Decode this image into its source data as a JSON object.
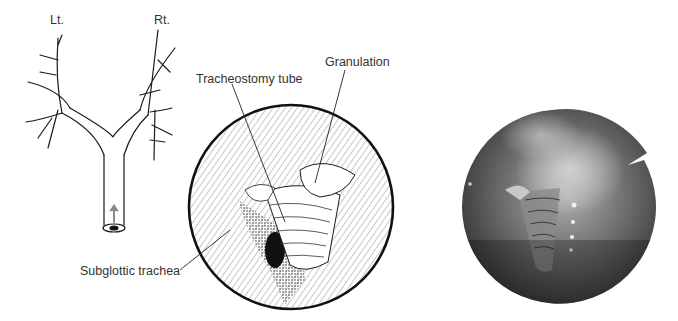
{
  "figure": {
    "bronchial_tree": {
      "left_label": "Lt.",
      "right_label": "Rt."
    },
    "endoscopic_drawing": {
      "labels": {
        "tube": "Tracheostomy tube",
        "granulation": "Granulation",
        "subglottic": "Subglottic trachea"
      }
    },
    "endoscopic_photo": {
      "description": "Bronchoscopic photograph"
    }
  },
  "colors": {
    "line": "#1a1a1a",
    "text": "#333333",
    "photo_dark": "#2e2e2e",
    "photo_light": "#b8b8b8"
  }
}
